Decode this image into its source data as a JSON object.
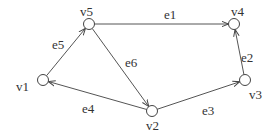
{
  "diagram": {
    "type": "directed-graph",
    "nodes": [
      {
        "id": "v1",
        "label": "v1",
        "x": 43,
        "y": 80,
        "lx": 16,
        "ly": 91
      },
      {
        "id": "v2",
        "label": "v2",
        "x": 152,
        "y": 111,
        "lx": 146,
        "ly": 130
      },
      {
        "id": "v3",
        "label": "v3",
        "x": 245,
        "y": 80,
        "lx": 249,
        "ly": 99
      },
      {
        "id": "v4",
        "label": "v4",
        "x": 234,
        "y": 24,
        "lx": 231,
        "ly": 16
      },
      {
        "id": "v5",
        "label": "v5",
        "x": 89,
        "y": 24,
        "lx": 80,
        "ly": 16
      }
    ],
    "edges": [
      {
        "id": "e1",
        "label": "e1",
        "from": "v5",
        "to": "v4",
        "lx": 164,
        "ly": 19
      },
      {
        "id": "e2",
        "label": "e2",
        "from": "v3",
        "to": "v4",
        "lx": 241,
        "ly": 62
      },
      {
        "id": "e3",
        "label": "e3",
        "from": "v2",
        "to": "v3",
        "lx": 202,
        "ly": 115
      },
      {
        "id": "e4",
        "label": "e4",
        "from": "v2",
        "to": "v1",
        "lx": 82,
        "ly": 113
      },
      {
        "id": "e5",
        "label": "e5",
        "from": "v1",
        "to": "v5",
        "lx": 52,
        "ly": 49
      },
      {
        "id": "e6",
        "label": "e6",
        "from": "v5",
        "to": "v2",
        "lx": 125,
        "ly": 67
      }
    ]
  }
}
